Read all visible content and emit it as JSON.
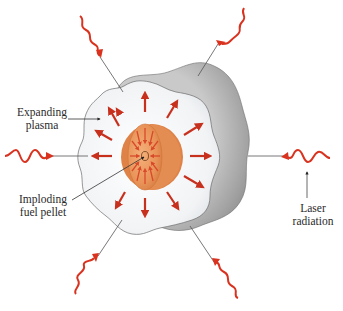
{
  "figure": {
    "type": "diagram"
  },
  "labels": {
    "expanding_plasma": {
      "line1": "Expanding",
      "line2": "plasma"
    },
    "imploding_pellet": {
      "line1": "Imploding",
      "line2": "fuel pellet"
    },
    "laser_radiation": {
      "line1": "Laser",
      "line2": "radiation"
    }
  },
  "colors": {
    "laser_red": "#d9321f",
    "arrow_red": "#c8301e",
    "shell_gray": "#9a9a9a",
    "shell_gray_light": "#d4d4d4",
    "plasma_white": "#eef0f2",
    "pellet_orange": "#e8955a",
    "pellet_orange_dark": "#d9773d",
    "leader_line": "#555555"
  },
  "laser_beams": [
    {
      "id": "top-left",
      "direction": "inward"
    },
    {
      "id": "top-right",
      "direction": "inward"
    },
    {
      "id": "left",
      "direction": "inward"
    },
    {
      "id": "right",
      "direction": "inward"
    },
    {
      "id": "bottom-left",
      "direction": "inward"
    },
    {
      "id": "bottom-right",
      "direction": "inward"
    }
  ],
  "plasma_arrows_count": 12,
  "pellet_inward_arrows_count": 12
}
